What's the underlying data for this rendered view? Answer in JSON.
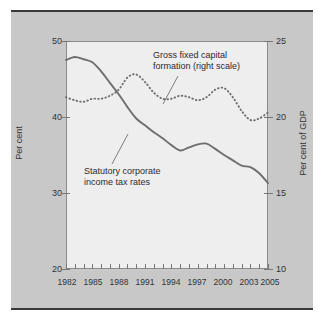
{
  "chart_data": {
    "type": "line",
    "title": "",
    "xlabel": "",
    "ylabel": "Per cent",
    "ylabel_right": "Per cent of GDP",
    "xlim": [
      1982,
      2005
    ],
    "ylim": [
      20,
      50
    ],
    "ylim_right": [
      10,
      25
    ],
    "yticks": [
      20,
      30,
      40,
      50
    ],
    "yticks_right": [
      10,
      15,
      20,
      25
    ],
    "xticks": [
      1982,
      1985,
      1988,
      1991,
      1994,
      1997,
      2000,
      2003,
      2005
    ],
    "xtick_minor_step": 1,
    "grid": false,
    "legend_position": "inline-annotations",
    "x": [
      1982,
      1983,
      1984,
      1985,
      1986,
      1987,
      1988,
      1989,
      1990,
      1991,
      1992,
      1993,
      1994,
      1995,
      1996,
      1997,
      1998,
      1999,
      2000,
      2001,
      2002,
      2003,
      2004,
      2005
    ],
    "series": [
      {
        "name": "Statutory corporate income tax rates",
        "style": "solid",
        "axis": "left",
        "color": "#6e6e6e",
        "values": [
          47.5,
          47.9,
          47.6,
          47.2,
          46.0,
          44.5,
          43.0,
          41.3,
          39.8,
          38.9,
          38.0,
          37.2,
          36.3,
          35.6,
          36.0,
          36.4,
          36.5,
          35.8,
          35.0,
          34.3,
          33.6,
          33.4,
          32.6,
          31.3
        ]
      },
      {
        "name": "Gross fixed capital formation (right scale)",
        "style": "dotted",
        "axis": "right",
        "color": "#6e6e6e",
        "values": [
          21.3,
          21.1,
          21.0,
          21.2,
          21.2,
          21.4,
          21.8,
          22.6,
          22.8,
          22.3,
          21.6,
          21.2,
          21.2,
          21.4,
          21.3,
          21.1,
          21.3,
          21.8,
          21.9,
          21.3,
          20.4,
          19.8,
          19.9,
          20.3
        ]
      }
    ],
    "annotations": [
      {
        "name": "gross-fixed-capital-formation-label",
        "line1": "Gross fixed capital",
        "line2": "formation (right scale)"
      },
      {
        "name": "statutory-corporate-income-tax-rates-label",
        "line1": "Statutory corporate",
        "line2": "income tax rates"
      }
    ]
  },
  "axes": {
    "left_ticks": [
      "50",
      "40",
      "30",
      "20"
    ],
    "right_ticks": [
      "25",
      "20",
      "15",
      "10"
    ],
    "x_ticks": [
      "1982",
      "1985",
      "1988",
      "1991",
      "1994",
      "1997",
      "2000",
      "2003",
      "2005"
    ],
    "left_title": "Per cent",
    "right_title": "Per cent of GDP"
  },
  "colors": {
    "page_background": "#ffffff",
    "panel_background": "#c8c8c8",
    "plot_background": "#eeeeee",
    "rule": "#3a3a3a",
    "series": "#6e6e6e",
    "text": "#333333"
  }
}
